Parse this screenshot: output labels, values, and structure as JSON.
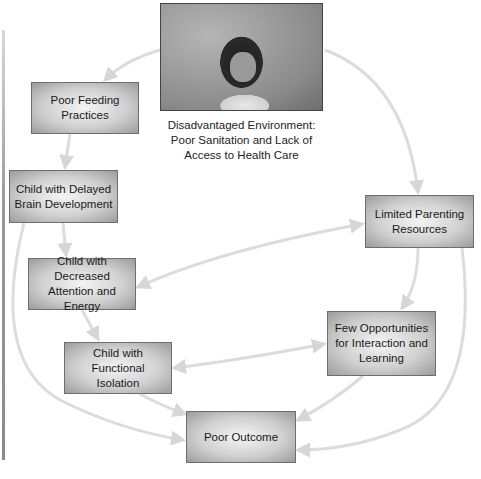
{
  "diagram": {
    "type": "flowchart",
    "image": {
      "description": "Photograph of a young child with a finger to her mouth against a weathered wall",
      "caption": "Disadvantaged Environment:\nPoor Sanitation and Lack of\nAccess to Health Care"
    },
    "nodes": [
      {
        "id": "poor_feeding",
        "label": "Poor Feeding\nPractices"
      },
      {
        "id": "delayed_brain",
        "label": "Child with Delayed\nBrain Development"
      },
      {
        "id": "decreased_attention",
        "label": "Child with Decreased\nAttention and Energy"
      },
      {
        "id": "functional_isolation",
        "label": "Child with\nFunctional Isolation"
      },
      {
        "id": "limited_parenting",
        "label": "Limited Parenting\nResources"
      },
      {
        "id": "few_opportunities",
        "label": "Few Opportunities\nfor Interaction and\nLearning"
      },
      {
        "id": "poor_outcome",
        "label": "Poor Outcome"
      }
    ],
    "edges": [
      {
        "from": "disadvantaged_environment",
        "to": "poor_feeding"
      },
      {
        "from": "disadvantaged_environment",
        "to": "limited_parenting"
      },
      {
        "from": "poor_feeding",
        "to": "delayed_brain"
      },
      {
        "from": "delayed_brain",
        "to": "decreased_attention"
      },
      {
        "from": "delayed_brain",
        "to": "poor_outcome"
      },
      {
        "from": "decreased_attention",
        "to": "functional_isolation"
      },
      {
        "from": "decreased_attention",
        "to": "limited_parenting",
        "bidirectional": true
      },
      {
        "from": "functional_isolation",
        "to": "few_opportunities",
        "bidirectional": true
      },
      {
        "from": "functional_isolation",
        "to": "poor_outcome"
      },
      {
        "from": "limited_parenting",
        "to": "few_opportunities"
      },
      {
        "from": "limited_parenting",
        "to": "poor_outcome"
      },
      {
        "from": "few_opportunities",
        "to": "poor_outcome"
      }
    ],
    "colors": {
      "box_border": "#6e6e6e",
      "box_center": "#f4f4f4",
      "box_edge": "#9c9c9c",
      "arrow": "#dcdcdc"
    }
  }
}
